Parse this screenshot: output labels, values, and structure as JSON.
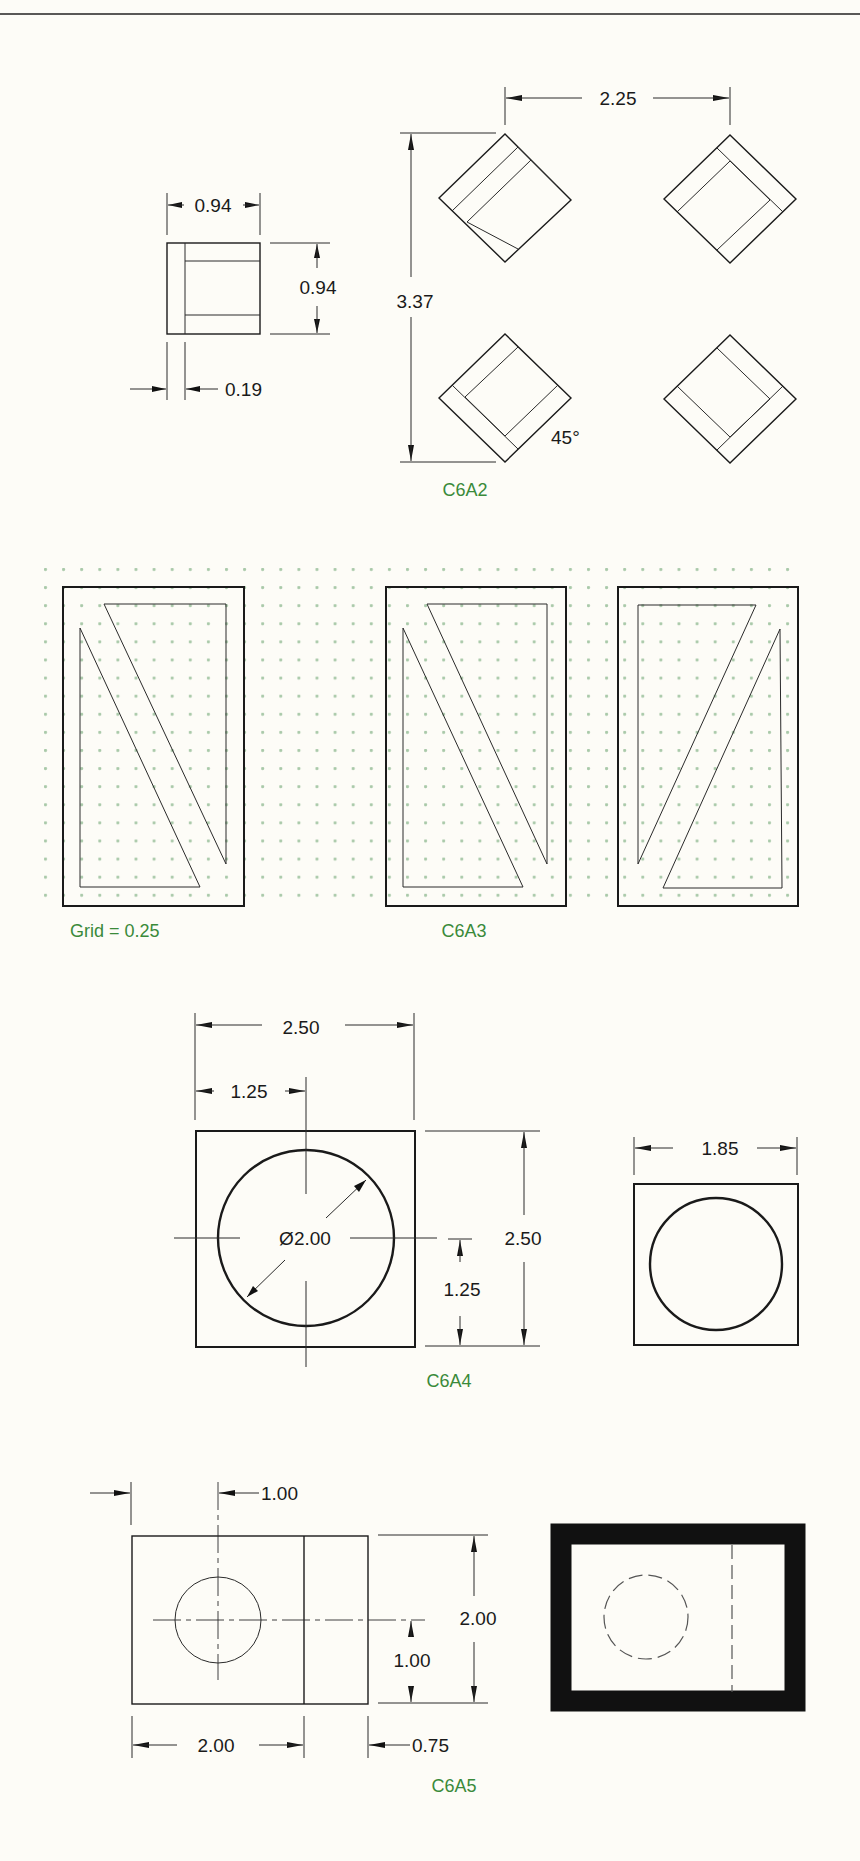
{
  "page": {
    "background": "#fdfcf7",
    "label_color": "#3a8a3a",
    "grid_dot_color": "#a9c9a9"
  },
  "c6a2": {
    "label": "C6A2",
    "small_view": {
      "width_dim": "0.94",
      "height_dim": "0.94",
      "offset_dim": "0.19"
    },
    "spacing_horizontal": "2.25",
    "spacing_vertical": "3.37",
    "angle": "45°"
  },
  "c6a3": {
    "label": "C6A3",
    "grid_note": "Grid = 0.25"
  },
  "c6a4": {
    "label": "C6A4",
    "overall_width": "2.50",
    "center_x": "1.25",
    "diameter": "Ø2.00",
    "overall_height": "2.50",
    "center_y": "1.25",
    "second_view_width": "1.85"
  },
  "c6a5": {
    "label": "C6A5",
    "hole_x": "1.00",
    "overall_height": "2.00",
    "hole_y": "1.00",
    "left_width": "2.00",
    "right_width": "0.75"
  }
}
